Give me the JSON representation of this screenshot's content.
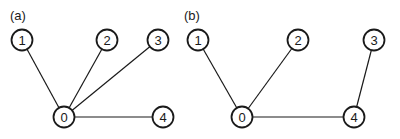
{
  "panels": [
    {
      "label": "(a)",
      "nodes": [
        "0",
        "1",
        "2",
        "3",
        "4"
      ],
      "edges": [
        [
          "0",
          "1"
        ],
        [
          "0",
          "2"
        ],
        [
          "0",
          "3"
        ],
        [
          "0",
          "4"
        ]
      ]
    },
    {
      "label": "(b)",
      "nodes": [
        "0",
        "1",
        "2",
        "3",
        "4"
      ],
      "edges": [
        [
          "0",
          "1"
        ],
        [
          "0",
          "2"
        ],
        [
          "0",
          "4"
        ],
        [
          "4",
          "3"
        ]
      ]
    }
  ]
}
